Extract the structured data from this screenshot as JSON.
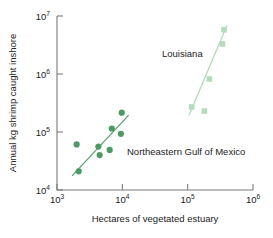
{
  "chart_data": {
    "type": "scatter",
    "title": "",
    "xlabel": "Hectares of vegetated estuary",
    "ylabel": "Annual kg shrimp caught inshore",
    "xscale": "log",
    "yscale": "log",
    "xlim": [
      1000,
      1000000
    ],
    "ylim": [
      10000,
      10000000
    ],
    "grid": false,
    "legend": "inline-annotations",
    "xticks": [
      "10^3",
      "10^4",
      "10^5",
      "10^6"
    ],
    "xtick_labels": [
      {
        "base": "10",
        "exp": "3"
      },
      {
        "base": "10",
        "exp": "4"
      },
      {
        "base": "10",
        "exp": "5"
      },
      {
        "base": "10",
        "exp": "6"
      }
    ],
    "yticks": [
      "10^4",
      "10^5",
      "10^6",
      "10^7"
    ],
    "ytick_labels": [
      {
        "base": "10",
        "exp": "7"
      },
      {
        "base": "10",
        "exp": "6"
      },
      {
        "base": "10",
        "exp": "5"
      },
      {
        "base": "10",
        "exp": "4"
      }
    ],
    "series": [
      {
        "name": "Northeastern Gulf of Mexico",
        "marker": "circle",
        "color": "#4d9a64",
        "line_color": "#55a06a",
        "annotation": "Northeastern Gulf of Mexico",
        "points": [
          {
            "x": 2000,
            "y": 61000
          },
          {
            "x": 2150,
            "y": 21000
          },
          {
            "x": 4300,
            "y": 56000
          },
          {
            "x": 4500,
            "y": 40000
          },
          {
            "x": 6400,
            "y": 49000
          },
          {
            "x": 6900,
            "y": 115000
          },
          {
            "x": 9500,
            "y": 93000
          },
          {
            "x": 9800,
            "y": 215000
          }
        ],
        "trend_line": {
          "x1": 1700,
          "y1": 17500,
          "x2": 12500,
          "y2": 195000
        }
      },
      {
        "name": "Louisiana",
        "marker": "square",
        "color": "#b4dbbc",
        "line_color": "#aed9b6",
        "annotation": "Louisiana",
        "points": [
          {
            "x": 115000,
            "y": 270000
          },
          {
            "x": 180000,
            "y": 230000
          },
          {
            "x": 215000,
            "y": 820000
          },
          {
            "x": 340000,
            "y": 3300000
          },
          {
            "x": 360000,
            "y": 5800000
          }
        ],
        "trend_line": {
          "x1": 105000,
          "y1": 195000,
          "x2": 400000,
          "y2": 6900000
        }
      }
    ]
  },
  "annotations": {
    "louisiana": "Louisiana",
    "gulf": "Northeastern Gulf of Mexico"
  }
}
